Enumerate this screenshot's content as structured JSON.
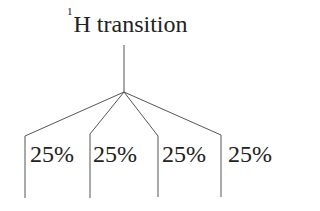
{
  "title": {
    "superscript": "1",
    "text": "H transition"
  },
  "branches": [
    {
      "label": "25%"
    },
    {
      "label": "25%"
    },
    {
      "label": "25%"
    },
    {
      "label": "25%"
    }
  ],
  "colors": {
    "line": "#555555",
    "text": "#222222"
  }
}
